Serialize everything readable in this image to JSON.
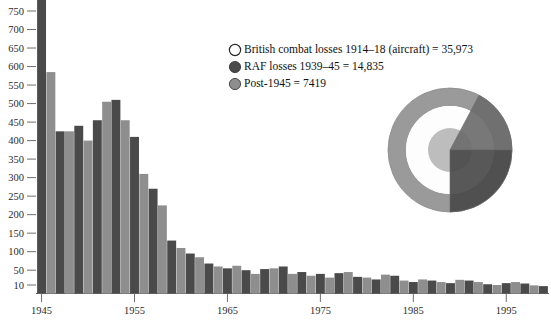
{
  "chart_data": {
    "type": "bar",
    "title": "",
    "subtitle": "",
    "xlabel": "",
    "ylabel": "",
    "grid": false,
    "legend_position": "top-right",
    "xlim": [
      1944.4,
      1999.6
    ],
    "ylim": [
      0,
      780
    ],
    "y_ticks": [
      10,
      50,
      100,
      150,
      200,
      250,
      300,
      350,
      400,
      450,
      500,
      550,
      600,
      650,
      700,
      750
    ],
    "x_ticks": [
      1945,
      1955,
      1965,
      1975,
      1985,
      1995
    ],
    "categories": [
      1945,
      1946,
      1947,
      1948,
      1949,
      1950,
      1951,
      1952,
      1953,
      1954,
      1955,
      1956,
      1957,
      1958,
      1959,
      1960,
      1961,
      1962,
      1963,
      1964,
      1965,
      1966,
      1967,
      1968,
      1969,
      1970,
      1971,
      1972,
      1973,
      1974,
      1975,
      1976,
      1977,
      1978,
      1979,
      1980,
      1981,
      1982,
      1983,
      1984,
      1985,
      1986,
      1987,
      1988,
      1989,
      1990,
      1991,
      1992,
      1993,
      1994,
      1995,
      1996,
      1997,
      1998,
      1999
    ],
    "values": [
      820,
      585,
      425,
      425,
      440,
      400,
      455,
      505,
      510,
      455,
      410,
      310,
      270,
      225,
      130,
      110,
      95,
      85,
      68,
      60,
      55,
      62,
      50,
      40,
      53,
      55,
      60,
      40,
      45,
      35,
      40,
      30,
      42,
      45,
      32,
      30,
      25,
      38,
      35,
      22,
      18,
      25,
      22,
      18,
      15,
      24,
      22,
      18,
      12,
      10,
      15,
      18,
      14,
      9,
      7
    ],
    "bar_colors_alternating": [
      "#4a4a4a",
      "#8e8e8e"
    ],
    "note_first_bar_clipped": "1945 bar extends above the plotted y-range"
  },
  "legend": {
    "items": [
      {
        "marker": "open-circle",
        "color": "#ffffff",
        "label": "British combat losses 1914–18 (aircraft) = 35,973"
      },
      {
        "marker": "filled-circle",
        "color": "#4a4a4a",
        "label": "RAF losses 1939–45 = 14,835"
      },
      {
        "marker": "filled-circle",
        "color": "#8e8e8e",
        "label": "Post-1945 = 7419"
      }
    ]
  },
  "pie": {
    "type": "pie",
    "description": "Concentric ring / nested proportional pie",
    "center": {
      "x": 450,
      "y": 150
    },
    "radius": 62,
    "rings": [
      {
        "name": "outer-ring",
        "color": "#9a9a9a",
        "outer_r": 62,
        "inner_r": 44
      },
      {
        "name": "white-ring",
        "color": "#fdfdfd",
        "outer_r": 44,
        "inner_r": 22
      },
      {
        "name": "inner-disc",
        "color": "#bdbdbd",
        "outer_r": 22,
        "inner_r": 0
      }
    ],
    "wedges": [
      {
        "name": "upper-right-wedge",
        "color": "#6d6d6d",
        "start_deg": -62,
        "end_deg": 0
      },
      {
        "name": "lower-right-wedge",
        "color": "#4a4a4a",
        "start_deg": 0,
        "end_deg": 90
      }
    ]
  },
  "axes": {
    "y_tick_labels": [
      "750",
      "700",
      "650",
      "600",
      "550",
      "500",
      "450",
      "400",
      "350",
      "300",
      "250",
      "200",
      "150",
      "100",
      "50",
      "10"
    ],
    "x_tick_labels": [
      "1945",
      "1955",
      "1965",
      "1975",
      "1985",
      "1995"
    ]
  },
  "colors": {
    "bar_dark": "#4a4a4a",
    "bar_light": "#8e8e8e",
    "axis": "#6f6f6f",
    "text": "#1a1a1a",
    "background": "#ffffff"
  }
}
